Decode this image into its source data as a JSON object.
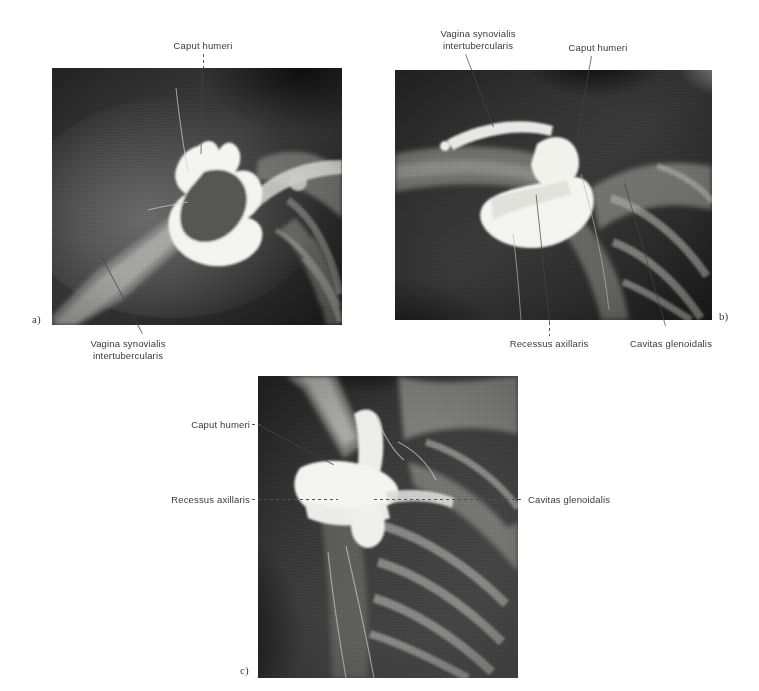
{
  "figure": {
    "background_color": "#ffffff",
    "modality": "shoulder-arthrogram-radiograph",
    "panels": [
      {
        "id": "a",
        "id_label": "a)",
        "labels": [
          {
            "text": "Caput humeri",
            "position": "top"
          },
          {
            "text": "Vagina synovialis\nintertubercularis",
            "position": "bottom"
          }
        ]
      },
      {
        "id": "b",
        "id_label": "b)",
        "labels": [
          {
            "text": "Vagina synovialis\nintertubercularis",
            "position": "top-left"
          },
          {
            "text": "Caput humeri",
            "position": "top-right"
          },
          {
            "text": "Recessus axillaris",
            "position": "bottom-left"
          },
          {
            "text": "Cavitas glenoidalis",
            "position": "bottom-right"
          }
        ]
      },
      {
        "id": "c",
        "id_label": "c)",
        "labels": [
          {
            "text": "Caput humeri",
            "position": "left-upper"
          },
          {
            "text": "Recessus axillaris",
            "position": "left-middle"
          },
          {
            "text": "Cavitas glenoidalis",
            "position": "right-middle"
          }
        ]
      }
    ]
  },
  "panel_a": {
    "id_label": "a)",
    "caput_humeri": "Caput humeri",
    "vagina_line1": "Vagina synovialis",
    "vagina_line2": "intertubercularis"
  },
  "panel_b": {
    "id_label": "b)",
    "vagina_line1": "Vagina synovialis",
    "vagina_line2": "intertubercularis",
    "caput_humeri": "Caput humeri",
    "recessus_axillaris": "Recessus axillaris",
    "cavitas_glenoidalis": "Cavitas glenoidalis"
  },
  "panel_c": {
    "id_label": "c)",
    "caput_humeri": "Caput humeri",
    "recessus_axillaris": "Recessus axillaris",
    "cavitas_glenoidalis": "Cavitas glenoidalis"
  },
  "colors": {
    "page": "#ffffff",
    "label_text": "#3a3a3a",
    "leader_line": "#555555",
    "film_dark": "#181818",
    "film_mid": "#6e6e6e",
    "contrast_bright": "#f2f2ee"
  }
}
